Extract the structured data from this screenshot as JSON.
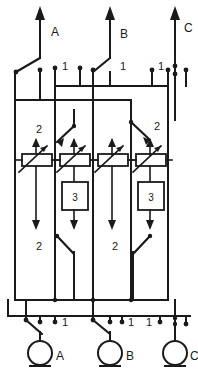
{
  "diagram": {
    "line_color": "#1a1a1a",
    "background_color": "#ffffff",
    "phases_top": [
      {
        "id": "A",
        "label": "A",
        "x": 40
      },
      {
        "id": "B",
        "label": "B",
        "x": 110
      },
      {
        "id": "C",
        "label": "C",
        "x": 175
      }
    ],
    "phases_bottom": [
      {
        "id": "A",
        "label": "A",
        "x": 40
      },
      {
        "id": "B",
        "label": "B",
        "x": 110
      },
      {
        "id": "C",
        "label": "C",
        "x": 175
      }
    ],
    "contact_labels_top": [
      {
        "label": "1",
        "x": 40
      },
      {
        "label": "1",
        "x": 110
      },
      {
        "label": "1",
        "x": 175
      }
    ],
    "contact_labels_bottom": [
      {
        "label": "1",
        "x": 40
      },
      {
        "label": "1",
        "x": 110
      },
      {
        "label": "1",
        "x": 175
      }
    ],
    "contact_labels_mid_upper": [
      {
        "label": "2",
        "x": 40
      },
      {
        "label": "2",
        "x": 145
      }
    ],
    "contact_labels_mid_lower": [
      {
        "label": "2",
        "x": 40
      },
      {
        "label": "2",
        "x": 145
      }
    ],
    "component_boxes": [
      {
        "label": "3",
        "x": 74
      },
      {
        "label": "3",
        "x": 150
      }
    ],
    "resistors": [
      {
        "x": 36,
        "group": "left"
      },
      {
        "x": 74,
        "group": "left"
      },
      {
        "x": 112,
        "group": "right"
      },
      {
        "x": 150,
        "group": "right"
      }
    ],
    "bus_lines_x": [
      15,
      55,
      93,
      131,
      168
    ]
  }
}
